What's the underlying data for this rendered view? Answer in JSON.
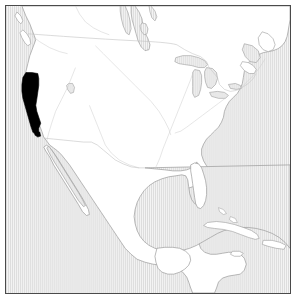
{
  "figure": {
    "type": "locator-map",
    "subject_region": "California",
    "projection_note": "North America, continental view",
    "caption": ""
  },
  "frame": {
    "border_color": "#4a4a4a",
    "border_width_px": 1,
    "margin_px": 5,
    "background_color": "#ffffff"
  },
  "legend": {
    "highlight_label": "California",
    "highlight_color": "#000000",
    "land_label": "Land",
    "land_color": "#ffffff",
    "water_label": "Water",
    "water_color": "#e4e4e4",
    "border_line_label": "Political boundaries",
    "border_line_color": "#b4b4b4"
  },
  "map": {
    "width": 286,
    "height": 289,
    "water_hatch": {
      "pattern": "vertical-lines",
      "stroke": "#dcdcdc",
      "background": "#f4f4f4",
      "spacing_px": 2,
      "stroke_width_px": 1
    },
    "land_fill": "#ffffff",
    "coast_stroke": "#9a9a9a",
    "coast_stroke_width": 0.7,
    "internal_stroke": "#c8c8c8",
    "internal_stroke_width": 0.55,
    "highlight_fill": "#000000",
    "highlight_stroke": "#000000",
    "features": [
      {
        "name": "north-america-mainland",
        "kind": "land"
      },
      {
        "name": "vancouver-island",
        "kind": "land"
      },
      {
        "name": "queen-charlotte-islands",
        "kind": "land"
      },
      {
        "name": "baja-california-peninsula",
        "kind": "land"
      },
      {
        "name": "yucatan-peninsula",
        "kind": "land"
      },
      {
        "name": "florida-peninsula",
        "kind": "land"
      },
      {
        "name": "newfoundland",
        "kind": "land"
      },
      {
        "name": "nova-scotia",
        "kind": "land"
      },
      {
        "name": "cuba",
        "kind": "land"
      },
      {
        "name": "jamaica",
        "kind": "land"
      },
      {
        "name": "hispaniola",
        "kind": "land"
      },
      {
        "name": "bahamas",
        "kind": "land"
      },
      {
        "name": "hudson-bay",
        "kind": "water"
      },
      {
        "name": "great-lakes",
        "kind": "water"
      },
      {
        "name": "gulf-of-california",
        "kind": "water"
      },
      {
        "name": "gulf-of-mexico",
        "kind": "water"
      },
      {
        "name": "pacific-ocean",
        "kind": "water"
      },
      {
        "name": "atlantic-ocean",
        "kind": "water"
      },
      {
        "name": "great-salt-lake",
        "kind": "water"
      },
      {
        "name": "us-canada-border",
        "kind": "boundary"
      },
      {
        "name": "us-mexico-border",
        "kind": "boundary"
      },
      {
        "name": "mississippi-river",
        "kind": "river"
      },
      {
        "name": "missouri-river",
        "kind": "river"
      },
      {
        "name": "rio-grande",
        "kind": "river"
      },
      {
        "name": "california-highlight",
        "kind": "highlight"
      }
    ]
  }
}
